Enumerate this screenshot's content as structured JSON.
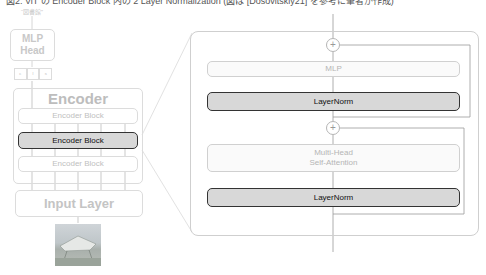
{
  "caption": "図2: ViT の Encoder Block 内の 2 Layer Normalization (図は [Dosovitskiy21] を参考に筆者が作成)",
  "left_panel": {
    "output_label": "“図書館”",
    "mlp_head": {
      "line1": "MLP",
      "line2": "Head"
    },
    "cls_tokens": [
      "c",
      "l",
      "s"
    ],
    "encoder": {
      "title": "Encoder",
      "blocks": [
        {
          "label": "Encoder Block",
          "highlighted": false
        },
        {
          "label": "Encoder Block",
          "highlighted": true
        },
        {
          "label": "Encoder Block",
          "highlighted": false
        }
      ]
    },
    "input_layer": "Input Layer",
    "input_image": "library-photo"
  },
  "right_panel": {
    "title": "Encoder Block (expanded)",
    "add_symbol": "+",
    "layers": [
      {
        "label": "MLP",
        "highlighted": false
      },
      {
        "label": "LayerNorm",
        "highlighted": true
      },
      {
        "label_line1": "Multi-Head",
        "label_line2": "Self-Attention",
        "highlighted": false
      },
      {
        "label": "LayerNorm",
        "highlighted": true
      }
    ]
  },
  "colors": {
    "highlight_fill": "#d8d8d8",
    "highlight_border": "#333333",
    "faint_border": "#dcdcdc",
    "faint_text": "#c8c8c8"
  }
}
